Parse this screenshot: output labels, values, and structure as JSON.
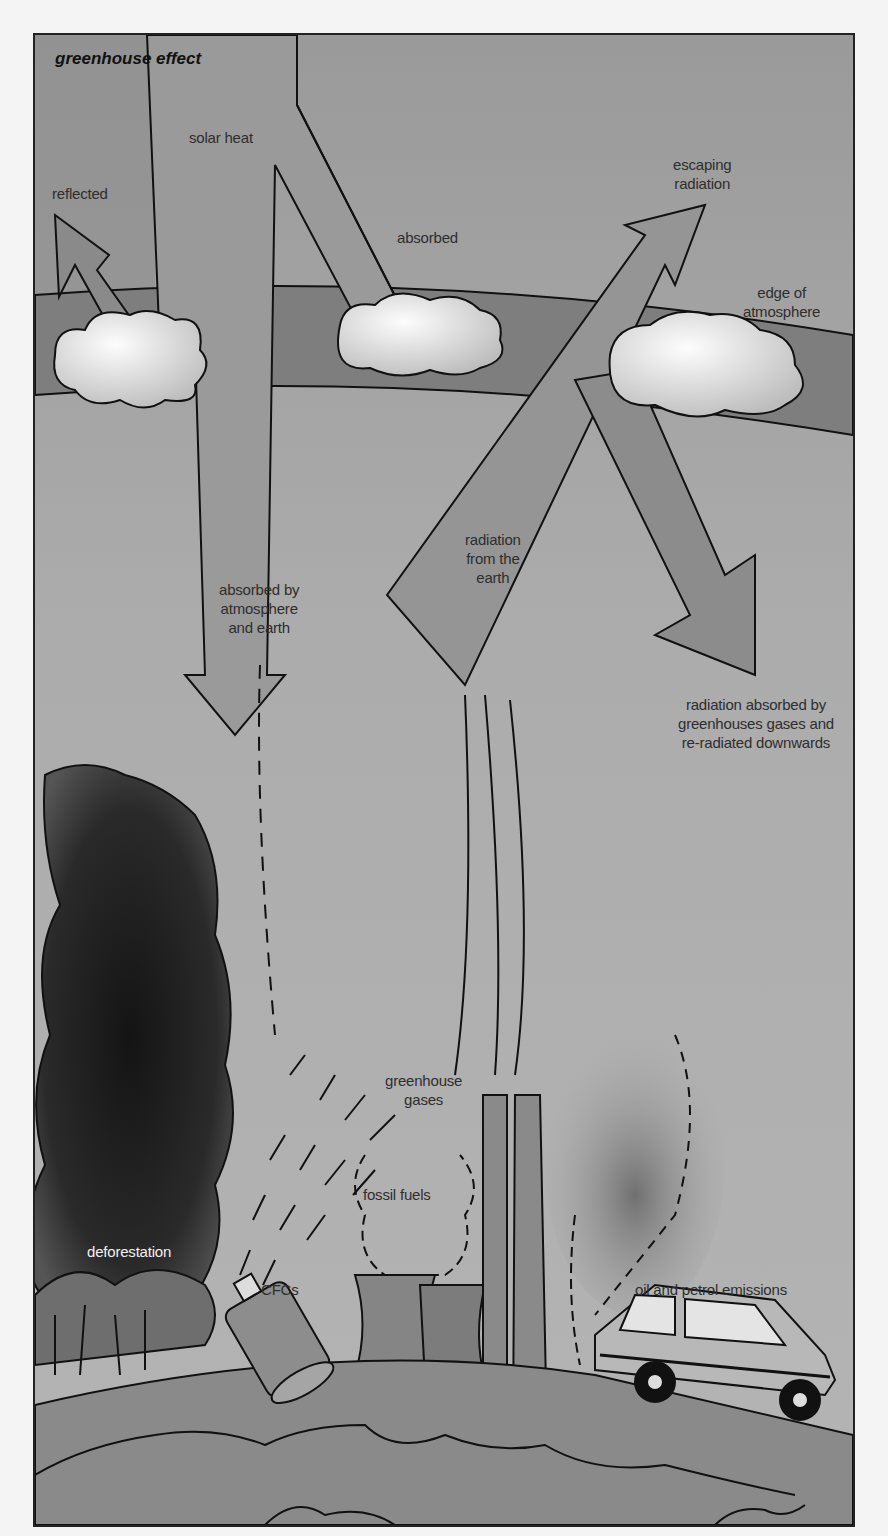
{
  "diagram": {
    "title": "greenhouse effect",
    "labels": {
      "solar_heat": "solar heat",
      "reflected": "reflected",
      "absorbed": "absorbed",
      "escaping_radiation": [
        "escaping",
        "radiation"
      ],
      "edge_of_atmosphere": [
        "edge of",
        "atmosphere"
      ],
      "absorbed_by_atmosphere": [
        "absorbed by",
        "atmosphere",
        "and earth"
      ],
      "radiation_from_earth": [
        "radiation",
        "from the",
        "earth"
      ],
      "re_radiated": [
        "radiation absorbed by",
        "greenhouses gases and",
        "re-radiated downwards"
      ],
      "greenhouse_gases": [
        "greenhouse",
        "gases"
      ],
      "fossil_fuels": "fossil fuels",
      "deforestation": "deforestation",
      "cfcs": "CFCs",
      "oil_petrol": "oil and petrol emissions"
    },
    "colors": {
      "sky": "#a9a9a9",
      "arrow": "#8c8c8c",
      "atmosphere_band": "#7e7e7e",
      "cloud": "#f2f2f2",
      "smoke": "#1e1e1e",
      "ground": "#8a8a8a",
      "outline": "#111111"
    }
  }
}
